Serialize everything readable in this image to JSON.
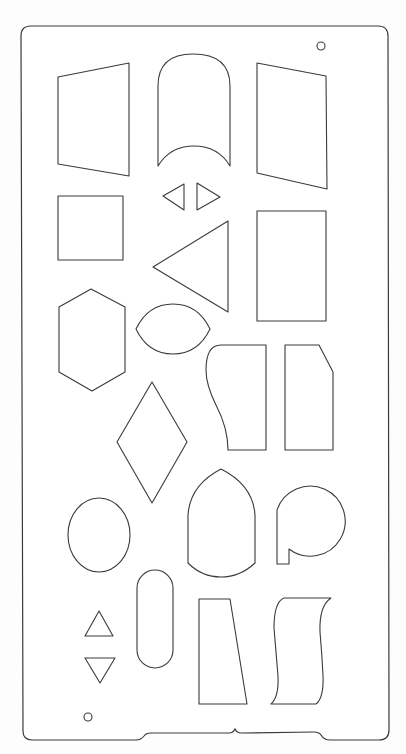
{
  "title": "Shape stencil template",
  "colors": {
    "background": "#fdfdfd",
    "stencil": "#ffffff",
    "outline": "#3a3a3a"
  },
  "stencil": {
    "holes": [
      "top-right hanging hole",
      "bottom-left hanging hole"
    ],
    "shapes": [
      {
        "id": "trapezoid-left",
        "label": "Left-leaning trapezoid"
      },
      {
        "id": "arch-concave",
        "label": "Rounded arch with concave base"
      },
      {
        "id": "trapezoid-right",
        "label": "Right-leaning trapezoid"
      },
      {
        "id": "small-triangle-left",
        "label": "Small left-pointing triangle"
      },
      {
        "id": "small-triangle-right",
        "label": "Small right-pointing triangle"
      },
      {
        "id": "square",
        "label": "Square"
      },
      {
        "id": "large-triangle",
        "label": "Large left-pointing triangle"
      },
      {
        "id": "rectangle",
        "label": "Rectangle"
      },
      {
        "id": "hexagon",
        "label": "Elongated hexagon"
      },
      {
        "id": "lens",
        "label": "Lens / pointed ellipse"
      },
      {
        "id": "curved-tab",
        "label": "Curved-edge tab"
      },
      {
        "id": "chamfered-rect",
        "label": "Chamfered rectangle"
      },
      {
        "id": "diamond",
        "label": "Diamond"
      },
      {
        "id": "oval",
        "label": "Oval"
      },
      {
        "id": "gothic-arch",
        "label": "Pointed (gothic) arch"
      },
      {
        "id": "p-shape",
        "label": "Circle with stem (P shape)"
      },
      {
        "id": "stadium",
        "label": "Stadium / pill"
      },
      {
        "id": "triangle-up",
        "label": "Up-pointing triangle"
      },
      {
        "id": "triangle-down",
        "label": "Down-pointing triangle"
      },
      {
        "id": "tapered-tab",
        "label": "Tapered tab"
      },
      {
        "id": "wavy-banner",
        "label": "Wavy banner"
      }
    ]
  }
}
